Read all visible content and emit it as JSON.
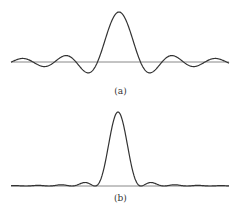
{
  "figure": {
    "panels": [
      {
        "label": "(a)",
        "description": "sinc function with large side lobes",
        "baseline_y": 62,
        "peak_y": 12,
        "center_x": 119
      },
      {
        "label": "(b)",
        "description": "narrower sinc-squared-like function with small side lobes",
        "baseline_y": 186,
        "peak_y": 112,
        "center_x": 118
      }
    ],
    "colors": {
      "curve": "#333333",
      "axis": "#888888",
      "background": "#ffffff"
    }
  }
}
